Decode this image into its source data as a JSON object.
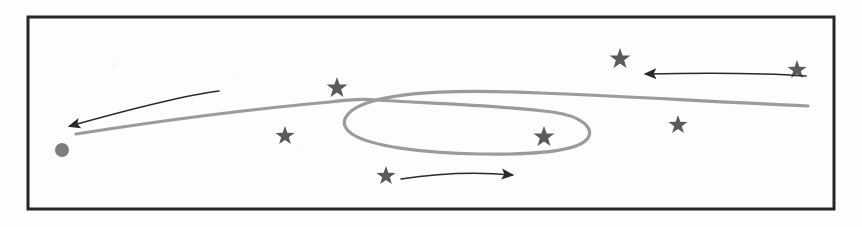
{
  "figure": {
    "medium": "scanned line drawing",
    "width": 862,
    "height": 227,
    "background_color": "#fdfdfd"
  },
  "frame": {
    "name": "border-rectangle",
    "x": 28,
    "y": 17,
    "width": 806,
    "height": 192,
    "stroke_color": "#262626",
    "stroke_width": 3,
    "fill": "none"
  },
  "trajectory": {
    "name": "main-trajectory-curve",
    "stroke_color": "#9b9b9b",
    "stroke_width": 3.2,
    "description": "Grey curve running left to right, crossing itself near x=375 to form a closed loop, then continuing to the right edge",
    "entry_path": "M 76,134 C 140,124 240,110 330,102 C 352,99 366,99 376,100",
    "loop_path": "M 376,100 C 420,103 500,105 552,112 C 582,116 594,128 588,138 C 580,150 540,155 480,154 C 420,153 370,146 352,134 C 338,124 344,112 364,104 C 400,90 470,90 540,93 C 620,96 700,101 808,106",
    "start_point": [
      76,
      134
    ],
    "end_point": [
      808,
      106
    ],
    "self_intersection_point": [
      375,
      100
    ]
  },
  "origin_marker": {
    "name": "origin-dot",
    "shape": "circle",
    "cx": 62,
    "cy": 150,
    "r": 7,
    "fill_color": "#7d7d7d"
  },
  "star_markers": {
    "name": "star-markers",
    "fill_color": "#5a5a5a",
    "count": 7,
    "items": [
      {
        "id": "star-upper-left-mid",
        "cx": 337,
        "cy": 88,
        "size": 11
      },
      {
        "id": "star-lower-left-mid",
        "cx": 285,
        "cy": 136,
        "size": 10
      },
      {
        "id": "star-below-loop",
        "cx": 386,
        "cy": 176,
        "size": 10
      },
      {
        "id": "star-inside-loop",
        "cx": 544,
        "cy": 137,
        "size": 11
      },
      {
        "id": "star-right-lower",
        "cx": 678,
        "cy": 125,
        "size": 10
      },
      {
        "id": "star-upper-right",
        "cx": 620,
        "cy": 59,
        "size": 11
      },
      {
        "id": "star-far-right",
        "cx": 797,
        "cy": 70,
        "size": 10
      }
    ]
  },
  "arrows": {
    "name": "direction-arrows",
    "stroke_color": "#2a2a2a",
    "stroke_width": 1.6,
    "items": [
      {
        "id": "arrow-leftward-upper",
        "direction": "left",
        "path": "M 219,91 C 180,96 120,112 70,126",
        "tip": [
          58,
          129
        ],
        "tail": [
          219,
          91
        ]
      },
      {
        "id": "arrow-rightward-lower",
        "direction": "right",
        "path": "M 401,179 C 440,173 480,172 512,175",
        "tip": [
          524,
          177
        ],
        "tail": [
          401,
          179
        ]
      },
      {
        "id": "arrow-leftward-right",
        "direction": "left",
        "path": "M 806,76 C 750,72 690,73 646,74",
        "tip": [
          632,
          74
        ],
        "tail": [
          806,
          76
        ]
      }
    ]
  }
}
